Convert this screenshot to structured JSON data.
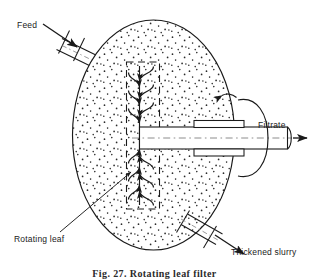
{
  "figure": {
    "caption": "Fig. 27.  Rotating leaf filter",
    "background_color": "#ffffff",
    "line_color": "#1a1a1a",
    "stipple_color": "#2b2b2b"
  },
  "labels": {
    "feed": "Feed",
    "filtrate": "Filtrate",
    "thickened_slurry": "Thickened slurry",
    "rotating_leaf": "Rotating leaf"
  },
  "components": {
    "vessel": "stippled-elliptical-vessel",
    "leaf": "dashed-rectangular-rotating-leaf",
    "shaft": "hollow-filtrate-shaft",
    "rotation_indicator": "rotation-arrow-ellipse",
    "feed_pipe": "flanged-feed-inlet-pipe",
    "slurry_pipe": "flanged-slurry-outlet-pipe",
    "flow_arrows_top": "downward-curved-flow-arrows",
    "flow_arrows_bottom": "upward-curved-flow-arrows"
  }
}
